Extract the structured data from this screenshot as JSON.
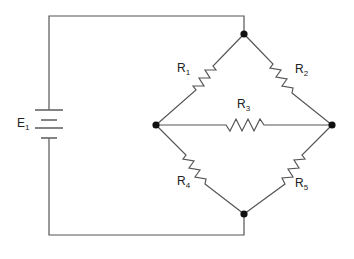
{
  "diagram": {
    "type": "circuit-schematic",
    "colors": {
      "wire": "#555555",
      "node": "#111111",
      "label": "#222222",
      "background": "#ffffff"
    },
    "source": {
      "id": "E",
      "sub": "1",
      "kind": "battery"
    },
    "resistors": [
      {
        "id": "R",
        "sub": "1",
        "from": "top-node",
        "to": "left-node"
      },
      {
        "id": "R",
        "sub": "2",
        "from": "top-node",
        "to": "right-node"
      },
      {
        "id": "R",
        "sub": "3",
        "from": "left-node",
        "to": "right-node"
      },
      {
        "id": "R",
        "sub": "4",
        "from": "left-node",
        "to": "bottom-node"
      },
      {
        "id": "R",
        "sub": "5",
        "from": "right-node",
        "to": "bottom-node"
      }
    ],
    "nodes": [
      "top-node",
      "left-node",
      "right-node",
      "bottom-node"
    ]
  }
}
